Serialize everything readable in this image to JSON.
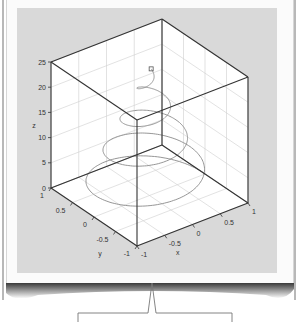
{
  "page": {
    "background": "#ffffff",
    "paper_color": "#fbfbfb",
    "plot_background": "#d9d9d9",
    "box_face_color": "#ffffff",
    "axis_color": "#333333",
    "grid_color": "#cfcfcf",
    "curve_color": "#8a8a8a"
  },
  "chart_data": {
    "type": "line3d",
    "title": "",
    "xlabel": "x",
    "ylabel": "y",
    "zlabel": "z",
    "xlim": [
      -1,
      1
    ],
    "ylim": [
      -1,
      1
    ],
    "zlim": [
      0,
      25
    ],
    "xticks": [
      "-1",
      "-0.5",
      "0",
      "0.5",
      "1"
    ],
    "yticks": [
      "-1",
      "-0.5",
      "0",
      "0.5",
      "1"
    ],
    "zticks": [
      "0",
      "5",
      "10",
      "15",
      "20",
      "25"
    ],
    "grid": true,
    "legend": null,
    "series": [
      {
        "name": "helix",
        "parametric": "x=(1-t/25)cos(t), y=(1-t/25)sin(t), z=t, t∈[0,25]",
        "turns": 4,
        "end_marker": "square",
        "end_point": [
          0.03,
          0.0,
          25
        ]
      }
    ]
  },
  "callout": {
    "bracket": "present"
  }
}
